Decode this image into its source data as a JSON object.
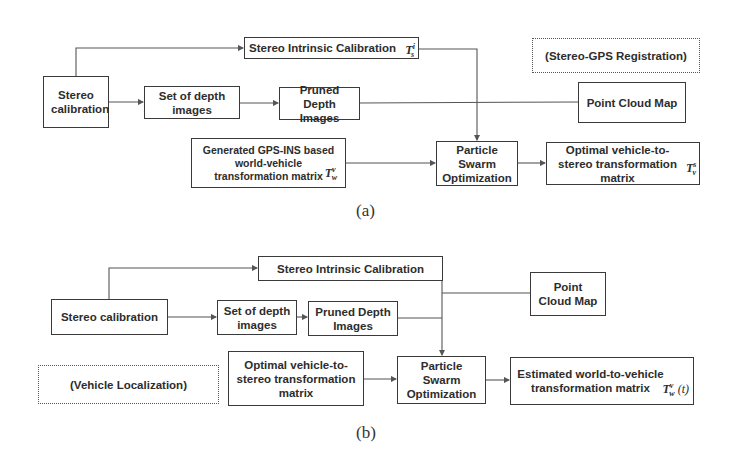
{
  "panel_a": {
    "caption": "(a)",
    "mode_label": "(Stereo-GPS Registration)",
    "nodes": {
      "stereo_calibration": "Stereo calibration",
      "set_of_depth_images": "Set of depth images",
      "pruned_depth_images": "Pruned Depth Images",
      "stereo_intrinsic_calibration": "Stereo Intrinsic Calibration",
      "stereo_intrinsic_symbol": "T",
      "stereo_intrinsic_sup": "i",
      "stereo_intrinsic_sub": "s",
      "gps_ins_matrix": "Generated GPS-INS based world-vehicle transformation matrix",
      "gps_ins_symbol": "T",
      "gps_ins_sup": "v",
      "gps_ins_sub": "w",
      "pso": "Particle Swarm Optimization",
      "point_cloud_map": "Point Cloud Map",
      "optimal_matrix": "Optimal vehicle-to-stereo transformation matrix",
      "optimal_symbol": "T",
      "optimal_sup": "s",
      "optimal_sub": "v"
    }
  },
  "panel_b": {
    "caption": "(b)",
    "mode_label": "(Vehicle Localization)",
    "nodes": {
      "stereo_calibration": "Stereo calibration",
      "set_of_depth_images": "Set of depth images",
      "pruned_depth_images": "Pruned Depth Images",
      "stereo_intrinsic_calibration": "Stereo Intrinsic Calibration",
      "optimal_matrix": "Optimal vehicle-to-stereo transformation matrix",
      "pso": "Particle Swarm Optimization",
      "point_cloud_map": "Point Cloud Map",
      "estimated_matrix": "Estimated world-to-vehicle transformation matrix",
      "estimated_symbol": "T",
      "estimated_sup": "v",
      "estimated_sub": "w",
      "estimated_arg": "(t)"
    }
  }
}
